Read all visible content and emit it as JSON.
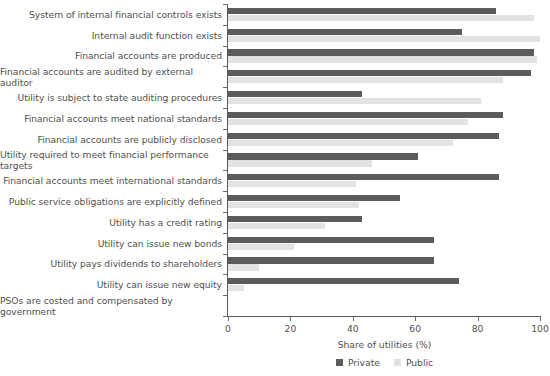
{
  "chart_data": {
    "type": "bar",
    "orientation": "horizontal",
    "title": "",
    "xlabel": "Share of utilities (%)",
    "ylabel": "",
    "xlim": [
      0,
      100
    ],
    "xticks": [
      0,
      20,
      40,
      60,
      80,
      100
    ],
    "xticklabels": [
      "0",
      "20",
      "40",
      "60",
      "80",
      "100"
    ],
    "grid": false,
    "legend_position": "bottom",
    "categories": [
      "System of internal financial controls exists",
      "Internal audit function exists",
      "Financial accounts are produced",
      "Financial accounts are audited by external auditor",
      "Utility is subject to state auditing procedures",
      "Financial accounts meet national standards",
      "Financial accounts are publicly disclosed",
      "Utility required to meet financial performance targets",
      "Financial accounts meet international standards",
      "Public service obligations are explicitly defined",
      "Utility has a credit rating",
      "Utility can issue new bonds",
      "Utility pays dividends to shareholders",
      "Utility can issue new equity",
      "PSOs are costed and compensated by government"
    ],
    "series": [
      {
        "name": "Private",
        "color": "#5b5b5b",
        "values": [
          86,
          75,
          98,
          97,
          43,
          88,
          87,
          61,
          87,
          55,
          43,
          66,
          66,
          74,
          0
        ]
      },
      {
        "name": "Public",
        "color": "#e2e2e2",
        "values": [
          98,
          100,
          99,
          88,
          81,
          77,
          72,
          46,
          41,
          42,
          31,
          21,
          10,
          5,
          0
        ]
      }
    ]
  },
  "legend": {
    "items": [
      {
        "label": "Private",
        "color": "#5b5b5b"
      },
      {
        "label": "Public",
        "color": "#e2e2e2"
      }
    ]
  },
  "axis": {
    "x_title": "Share of utilities (%)"
  }
}
